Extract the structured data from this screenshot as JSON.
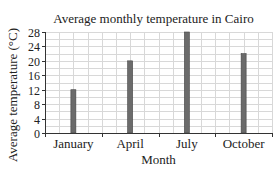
{
  "chart_data": {
    "type": "bar",
    "title": "Average monthly temperature in Cairo",
    "xlabel": "Month",
    "ylabel": "Average temperature (°C)",
    "categories": [
      "January",
      "April",
      "July",
      "October"
    ],
    "values": [
      12,
      20,
      28,
      22
    ],
    "yticks": [
      "0",
      "4",
      "8",
      "12",
      "16",
      "20",
      "24",
      "28"
    ],
    "ylim": [
      0,
      28
    ],
    "grid": true,
    "legend": "none",
    "bar_color": "#6b6b6b"
  }
}
